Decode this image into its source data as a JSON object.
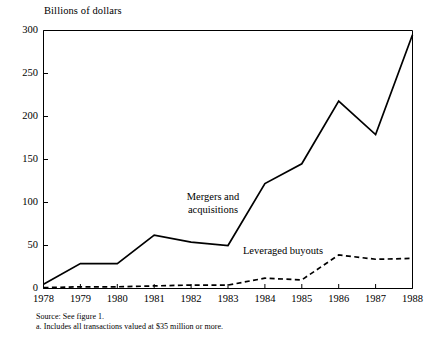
{
  "chart_data": {
    "type": "line",
    "title": "",
    "ylabel": "Billions of dollars",
    "xlabel": "",
    "ylim": [
      0,
      300
    ],
    "yticks": [
      0,
      50,
      100,
      150,
      200,
      250,
      300
    ],
    "ytick_labels": [
      "0",
      "50",
      "100",
      "150",
      "200",
      "250",
      "300"
    ],
    "x": [
      1978,
      1979,
      1980,
      1981,
      1982,
      1983,
      1984,
      1985,
      1986,
      1987,
      1988
    ],
    "xtick_labels": [
      "1978",
      "1979",
      "1980",
      "1981",
      "1982",
      "1983",
      "1984",
      "1985",
      "1986",
      "1987",
      "1988"
    ],
    "grid": false,
    "legend_position": "inline-annotations",
    "series": [
      {
        "name": "Mergers and acquisitions",
        "label_line1": "Mergers and",
        "label_line2": "acquisitions",
        "style": "solid",
        "color": "#000000",
        "values": [
          5,
          29,
          29,
          62,
          54,
          50,
          122,
          145,
          218,
          179,
          295
        ]
      },
      {
        "name": "Leveraged buyouts",
        "label_line1": "Leveraged buyouts",
        "label_line2": "",
        "style": "dashed",
        "color": "#000000",
        "values": [
          1,
          2,
          2,
          3,
          4,
          4,
          12,
          10,
          39,
          34,
          35
        ]
      }
    ],
    "annotations": [
      "Mergers and acquisitions",
      "Leveraged buyouts"
    ]
  },
  "axis": {
    "y_title": "Billions of dollars"
  },
  "footnotes": {
    "source": "Source: See figure 1.",
    "note_a": "a.  Includes all transactions valued at $35 million or more."
  }
}
